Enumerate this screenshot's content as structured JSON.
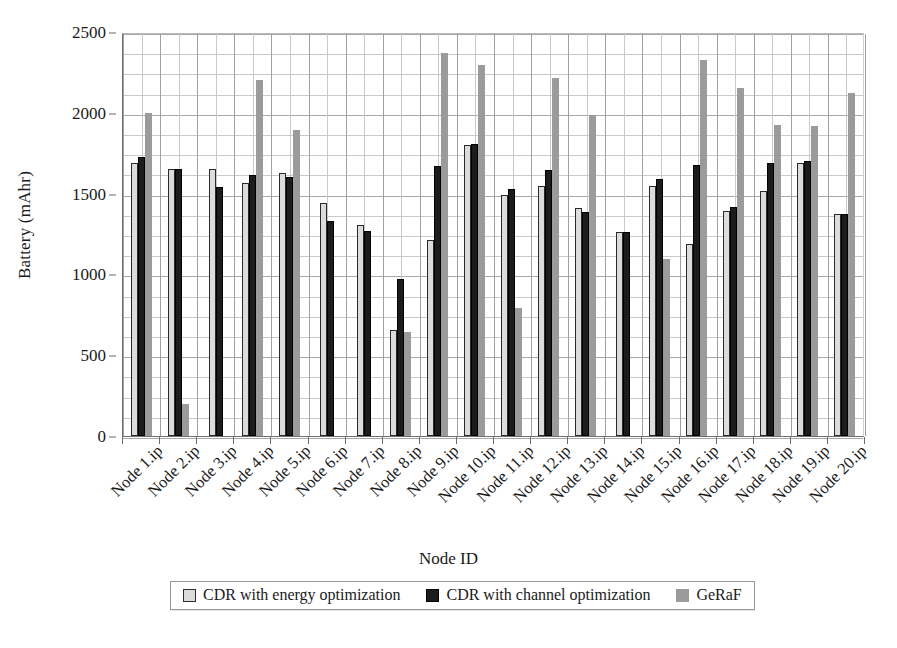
{
  "chart_data": {
    "type": "bar",
    "title": "",
    "xlabel": "Node ID",
    "ylabel": "Battery (mAhr)",
    "ylim": [
      0,
      2500
    ],
    "yticks": [
      0,
      500,
      1000,
      1500,
      2000,
      2500
    ],
    "ytick_labels": [
      "0",
      "500",
      "1000",
      "1500",
      "2000",
      "2500"
    ],
    "grid": true,
    "grid_minor_y": true,
    "legend_position": "bottom",
    "categories": [
      "Node 1.ip",
      "Node 2.ip",
      "Node 3.ip",
      "Node 4.ip",
      "Node 5.ip",
      "Node 6.ip",
      "Node 7.ip",
      "Node 8.ip",
      "Node 9.ip",
      "Node 10.ip",
      "Node 11.ip",
      "Node 12.ip",
      "Node 13.ip",
      "Node 14.ip",
      "Node 15.ip",
      "Node 16.ip",
      "Node 17.ip",
      "Node 18.ip",
      "Node 19.ip",
      "Node 20.ip"
    ],
    "series": [
      {
        "name": "CDR with energy optimization",
        "color": "#dcdcdc",
        "values": [
          1690,
          1650,
          1655,
          1565,
          1625,
          1440,
          1305,
          655,
          1210,
          1800,
          1490,
          1545,
          1410,
          1265,
          1550,
          1190,
          1390,
          1515,
          1690,
          1375
        ]
      },
      {
        "name": "CDR with channel optimization",
        "color": "#1c1c1c",
        "values": [
          1725,
          1650,
          1540,
          1615,
          1600,
          1330,
          1270,
          970,
          1670,
          1810,
          1530,
          1645,
          1385,
          1265,
          1590,
          1680,
          1415,
          1690,
          1700,
          1375
        ]
      },
      {
        "name": "GeRaF",
        "color": "#9b9b9b",
        "values": [
          2000,
          200,
          0,
          2200,
          1895,
          0,
          0,
          645,
          2370,
          2295,
          795,
          2215,
          1985,
          0,
          1095,
          2325,
          2155,
          1925,
          1920,
          2120
        ]
      }
    ]
  },
  "axis": {
    "y_title": "Battery (mAhr)",
    "x_title": "Node ID"
  },
  "legend": {
    "items": [
      {
        "label": "CDR with energy optimization",
        "swatch": "light-gray-square-icon"
      },
      {
        "label": "CDR with channel optimization",
        "swatch": "black-square-icon"
      },
      {
        "label": "GeRaF",
        "swatch": "gray-square-icon"
      }
    ]
  }
}
